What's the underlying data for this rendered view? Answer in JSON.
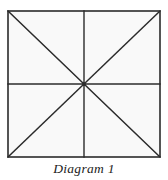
{
  "figure": {
    "caption": "Diagram 1",
    "colors": {
      "line": "#2b2b2b",
      "border": "#2b2b2b",
      "fill": "#f9f9f9",
      "background": "#ffffff",
      "caption_text": "#1c1c1c"
    },
    "shape": {
      "name": "square",
      "left": 8,
      "top": 11,
      "right": 160,
      "bottom": 157,
      "width": 152,
      "height": 146,
      "stroke_width": 1.6
    },
    "lines": [
      {
        "name": "top-edge",
        "kind": "border",
        "x1": 8,
        "y1": 11,
        "x2": 160,
        "y2": 11
      },
      {
        "name": "right-edge",
        "kind": "border",
        "x1": 160,
        "y1": 11,
        "x2": 160,
        "y2": 157
      },
      {
        "name": "bottom-edge",
        "kind": "border",
        "x1": 160,
        "y1": 157,
        "x2": 8,
        "y2": 157
      },
      {
        "name": "left-edge",
        "kind": "border",
        "x1": 8,
        "y1": 157,
        "x2": 8,
        "y2": 11
      },
      {
        "name": "horizontal-median",
        "kind": "median",
        "x1": 8,
        "y1": 84,
        "x2": 160,
        "y2": 84
      },
      {
        "name": "vertical-median",
        "kind": "median",
        "x1": 84,
        "y1": 11,
        "x2": 84,
        "y2": 157
      },
      {
        "name": "diagonal-tl-br",
        "kind": "diagonal",
        "x1": 8,
        "y1": 11,
        "x2": 160,
        "y2": 157
      },
      {
        "name": "diagonal-tr-bl",
        "kind": "diagonal",
        "x1": 160,
        "y1": 11,
        "x2": 8,
        "y2": 157
      }
    ],
    "center_point": {
      "x": 84,
      "y": 84
    },
    "region_count": 8,
    "corners": [
      {
        "name": "top-left",
        "x": 8,
        "y": 11
      },
      {
        "name": "top-right",
        "x": 160,
        "y": 11
      },
      {
        "name": "bottom-right",
        "x": 160,
        "y": 157
      },
      {
        "name": "bottom-left",
        "x": 8,
        "y": 157
      }
    ]
  }
}
